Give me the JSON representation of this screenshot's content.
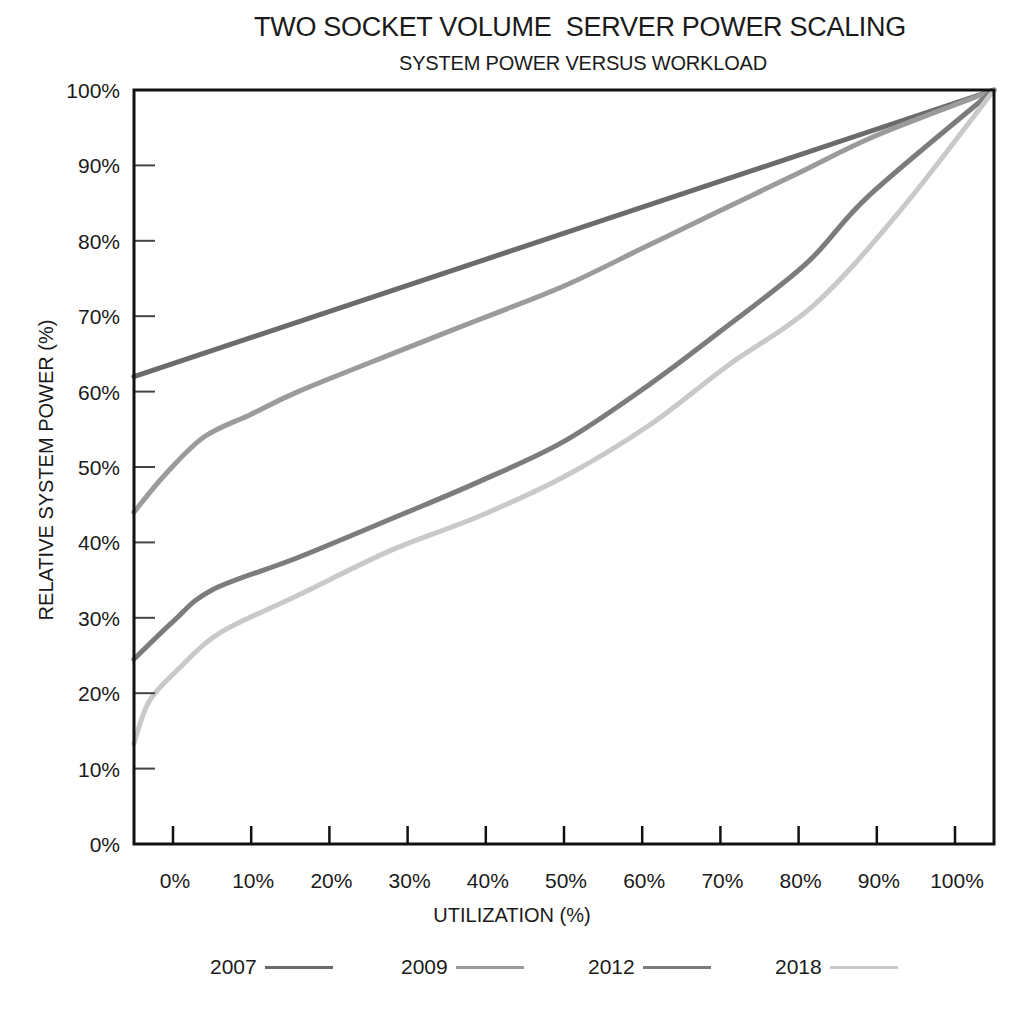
{
  "chart_data": {
    "type": "line",
    "title": "TWO SOCKET VOLUME  SERVER POWER SCALING",
    "subtitle": "SYSTEM POWER VERSUS WORKLOAD",
    "xlabel": "UTILIZATION (%)",
    "ylabel": "RELATIVE SYSTEM POWER (%)",
    "xlim": [
      -5,
      105
    ],
    "ylim": [
      0,
      100
    ],
    "grid": false,
    "legend_position": "bottom",
    "x_ticks": [
      "0%",
      "10%",
      "20%",
      "30%",
      "40%",
      "50%",
      "60%",
      "70%",
      "80%",
      "90%",
      "100%"
    ],
    "y_ticks": [
      "0%",
      "10%",
      "20%",
      "30%",
      "40%",
      "50%",
      "60%",
      "70%",
      "80%",
      "90%",
      "100%"
    ],
    "series": [
      {
        "name": "2007",
        "color": "#6b6b6b",
        "points": [
          [
            -5,
            62
          ],
          [
            105,
            100
          ]
        ]
      },
      {
        "name": "2009",
        "color": "#9b9b9b",
        "points": [
          [
            -5,
            44
          ],
          [
            -1,
            49
          ],
          [
            4,
            54
          ],
          [
            10,
            57
          ],
          [
            16,
            60
          ],
          [
            28,
            65
          ],
          [
            39,
            69.5
          ],
          [
            50,
            74
          ],
          [
            60,
            79
          ],
          [
            70,
            84
          ],
          [
            80,
            89
          ],
          [
            90,
            94
          ],
          [
            105,
            100
          ]
        ]
      },
      {
        "name": "2012",
        "color": "#7c7c7c",
        "points": [
          [
            -5,
            24.5
          ],
          [
            0,
            29.5
          ],
          [
            5,
            33.7
          ],
          [
            16,
            38
          ],
          [
            29,
            43.6
          ],
          [
            39,
            48
          ],
          [
            50,
            53.4
          ],
          [
            61,
            61
          ],
          [
            70,
            68
          ],
          [
            81,
            77
          ],
          [
            89,
            86
          ],
          [
            105,
            100
          ]
        ]
      },
      {
        "name": "2018",
        "color": "#c9c9c9",
        "points": [
          [
            -5,
            13.3
          ],
          [
            -3,
            19
          ],
          [
            1,
            23.5
          ],
          [
            6,
            28
          ],
          [
            16,
            33
          ],
          [
            28,
            39
          ],
          [
            39,
            43.4
          ],
          [
            50,
            48.7
          ],
          [
            61,
            55.6
          ],
          [
            71,
            63.5
          ],
          [
            82,
            71.5
          ],
          [
            93,
            84
          ],
          [
            105,
            100
          ]
        ]
      }
    ]
  }
}
